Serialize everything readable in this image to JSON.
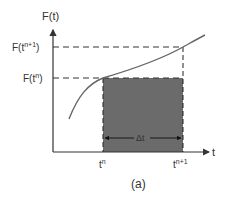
{
  "figure": {
    "caption": "(a)",
    "y_axis_label": "F(t)",
    "x_axis_label": "t",
    "y_ticks": [
      {
        "base": "F(t",
        "sup": "n+1",
        "close": ")"
      },
      {
        "base": "F(t",
        "sup": "n",
        "close": ")"
      }
    ],
    "x_ticks": [
      {
        "base": "t",
        "sup": "n"
      },
      {
        "base": "t",
        "sup": "n+1"
      }
    ],
    "interval_label": "Δt",
    "colors": {
      "axis": "#333333",
      "curve": "#666666",
      "shaded_region": "#6b6b6b",
      "dashed": "#333333"
    }
  }
}
